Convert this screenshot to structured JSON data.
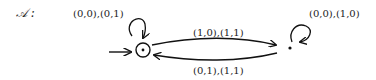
{
  "automaton": {
    "name": "𝒜 :",
    "states": [
      {
        "id": "q0",
        "initial": true,
        "accepting_marker": "dot-in-circle"
      },
      {
        "id": "q1",
        "initial": false,
        "accepting_marker": "dot"
      }
    ],
    "transitions": [
      {
        "from": "q0",
        "to": "q0",
        "label": "(0,0),(0,1)"
      },
      {
        "from": "q0",
        "to": "q1",
        "label": "(1,0),(1,1)"
      },
      {
        "from": "q1",
        "to": "q0",
        "label": "(0,1),(1,1)"
      },
      {
        "from": "q1",
        "to": "q1",
        "label": "(0,0),(1,0)"
      }
    ]
  }
}
